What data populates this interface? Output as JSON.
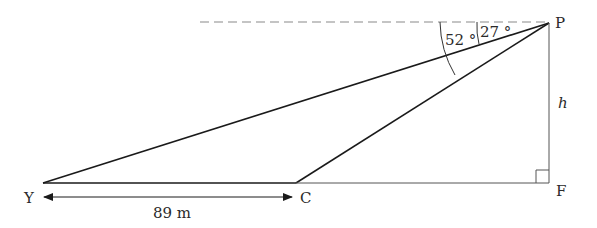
{
  "diagram": {
    "type": "angle-of-depression triangle",
    "points": {
      "P": {
        "label": "P",
        "x": 549,
        "y": 23
      },
      "Y": {
        "label": "Y",
        "x": 43,
        "y": 183
      },
      "C": {
        "label": "C",
        "x": 296,
        "y": 183
      },
      "F": {
        "label": "F",
        "x": 549,
        "y": 183
      }
    },
    "angles": {
      "angle_PY": {
        "label": "52 °",
        "value": 52
      },
      "angle_PC": {
        "label": "27 °",
        "value": 27
      }
    },
    "height_label": "h",
    "distance_label": "89 m",
    "distance_value": 89,
    "distance_unit": "m",
    "colors": {
      "line": "#1a1a1a",
      "dashed": "#8a8a8a",
      "thin": "#555555"
    }
  }
}
